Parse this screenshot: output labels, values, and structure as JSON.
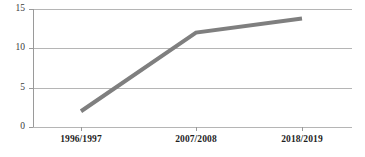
{
  "chart_data": {
    "type": "line",
    "title": "",
    "subtitle": "",
    "xlabel": "",
    "ylabel": "",
    "categories": [
      "1996/1997",
      "2007/2008",
      "2018/2019"
    ],
    "values": [
      2.0,
      12.0,
      13.8
    ],
    "series": [
      {
        "name": "",
        "values": [
          2.0,
          12.0,
          13.8
        ]
      }
    ],
    "ylim": [
      0,
      15
    ],
    "y_ticks": [
      0,
      5,
      10,
      15
    ],
    "y_tick_labels": [
      "0",
      "5",
      "10",
      "15"
    ],
    "x_ticks": [
      "1996/1997",
      "2007/2008",
      "2018/2019"
    ],
    "grid": true,
    "grid_axis": "y",
    "legend": false,
    "legend_position": "none",
    "annotations": [],
    "colors": {
      "line": "#7f7f7f",
      "grid": "#b5b5b5",
      "axis": "#9a9a9a",
      "tick_text": "#3a3a3a",
      "category_text": "#1f1f1f",
      "background": "#ffffff"
    },
    "style": {
      "line_width": 4,
      "markers": false
    }
  },
  "geometry": {
    "plot_left": 33,
    "plot_right": 352,
    "plot_top": 9,
    "plot_bottom": 127,
    "category_x": [
      81,
      196,
      302
    ]
  }
}
